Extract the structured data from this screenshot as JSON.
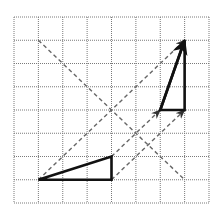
{
  "diagram": {
    "grid": {
      "columns": 8,
      "rows": 8,
      "x0": 14,
      "y0": 17,
      "cell_w": 24.375,
      "cell_h": 23.25,
      "line_color": "#7a7a7a"
    },
    "original_triangle": {
      "vertices": [
        [
          1,
          7
        ],
        [
          4,
          6
        ],
        [
          4,
          7
        ]
      ],
      "stroke": "#111111"
    },
    "image_triangle": {
      "vertices": [
        [
          6,
          4
        ],
        [
          7,
          1
        ],
        [
          7,
          4
        ]
      ],
      "stroke": "#111111"
    },
    "solid_arrows": [
      {
        "from": [
          6,
          4
        ],
        "to": [
          7,
          1
        ]
      }
    ],
    "dashed_arrows": [
      {
        "from": [
          1,
          7
        ],
        "to": [
          7,
          1
        ]
      },
      {
        "from": [
          4,
          6
        ],
        "to": [
          6,
          4
        ]
      },
      {
        "from": [
          4,
          7
        ],
        "to": [
          7,
          4
        ]
      }
    ],
    "dashed_lines": [
      {
        "from": [
          1,
          1
        ],
        "to": [
          7,
          7
        ]
      }
    ],
    "dash_color": "#666666"
  }
}
